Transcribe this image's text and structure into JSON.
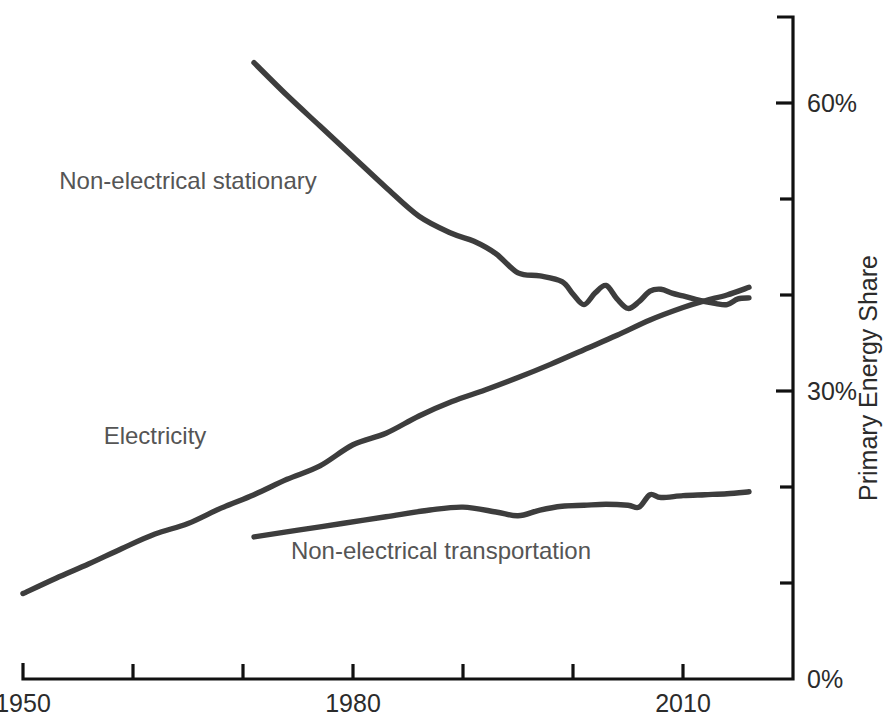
{
  "chart_data": {
    "type": "line",
    "title": "",
    "xlabel": "",
    "ylabel": "Primary Energy Share",
    "xlim": [
      1950,
      2017
    ],
    "ylim": [
      0,
      70
    ],
    "grid": false,
    "legend_position": "inline-labels",
    "x_tick_labels": [
      "1950",
      "1980",
      "2010"
    ],
    "x_ticks_major": [
      1950,
      1980,
      2010
    ],
    "x_ticks_minor": [
      1960,
      1970,
      1990,
      2000
    ],
    "y_tick_labels": [
      "0%",
      "30%",
      "60%"
    ],
    "y_ticks_major": [
      0,
      30,
      60
    ],
    "y_ticks_minor": [
      10,
      20,
      40,
      50
    ],
    "series": [
      {
        "name": "Non-electrical stationary",
        "color": "#3d3d3d",
        "label_x": 1965,
        "label_y": 51,
        "x": [
          1971,
          1974,
          1977,
          1980,
          1983,
          1986,
          1989,
          1991,
          1993,
          1995,
          1997,
          1999,
          2000,
          2001,
          2002,
          2003,
          2004,
          2005,
          2006,
          2007,
          2008,
          2009,
          2010,
          2011,
          2012,
          2013,
          2014,
          2015,
          2016
        ],
        "values": [
          64.2,
          60.8,
          57.6,
          54.4,
          51.2,
          48.2,
          46.4,
          45.6,
          44.3,
          42.3,
          42.0,
          41.4,
          40.1,
          39.0,
          40.2,
          41.0,
          39.6,
          38.6,
          39.3,
          40.4,
          40.6,
          40.2,
          39.9,
          39.6,
          39.3,
          39.1,
          39.0,
          39.6,
          39.7
        ]
      },
      {
        "name": "Electricity",
        "color": "#3d3d3d",
        "label_x": 1962,
        "label_y": 24.5,
        "x": [
          1950,
          1953,
          1956,
          1959,
          1962,
          1965,
          1968,
          1971,
          1974,
          1977,
          1980,
          1983,
          1986,
          1989,
          1992,
          1995,
          1998,
          2001,
          2004,
          2007,
          2010,
          2012,
          2014,
          2016
        ],
        "values": [
          8.9,
          10.5,
          12.0,
          13.6,
          15.1,
          16.2,
          17.8,
          19.2,
          20.8,
          22.2,
          24.4,
          25.6,
          27.4,
          28.9,
          30.1,
          31.4,
          32.8,
          34.3,
          35.8,
          37.4,
          38.7,
          39.4,
          40.0,
          40.8
        ]
      },
      {
        "name": "Non-electrical transportation",
        "color": "#3d3d3d",
        "label_x": 1988,
        "label_y": 12.5,
        "x": [
          1971,
          1975,
          1979,
          1983,
          1987,
          1990,
          1993,
          1995,
          1997,
          1999,
          2001,
          2003,
          2005,
          2006,
          2007,
          2008,
          2010,
          2012,
          2014,
          2016
        ],
        "values": [
          14.8,
          15.5,
          16.2,
          16.9,
          17.6,
          17.9,
          17.4,
          17.0,
          17.6,
          18.0,
          18.1,
          18.2,
          18.1,
          17.9,
          19.2,
          18.9,
          19.1,
          19.2,
          19.3,
          19.5
        ]
      }
    ]
  },
  "axes": {
    "y_axis_title": "Primary Energy Share",
    "y_labels": [
      {
        "text": "60%",
        "value": 60
      },
      {
        "text": "30%",
        "value": 30
      },
      {
        "text": "0%",
        "value": 0
      }
    ],
    "x_labels": [
      {
        "text": "1950",
        "value": 1950
      },
      {
        "text": "1980",
        "value": 1980
      },
      {
        "text": "2010",
        "value": 2010
      }
    ]
  },
  "series_labels": [
    {
      "text": "Non-electrical stationary"
    },
    {
      "text": "Electricity"
    },
    {
      "text": "Non-electrical transportation"
    }
  ],
  "colors": {
    "line": "#3d3d3d",
    "axis": "#111111",
    "tick_text": "#2b2b2b",
    "series_text": "#555555",
    "background": "#ffffff"
  }
}
